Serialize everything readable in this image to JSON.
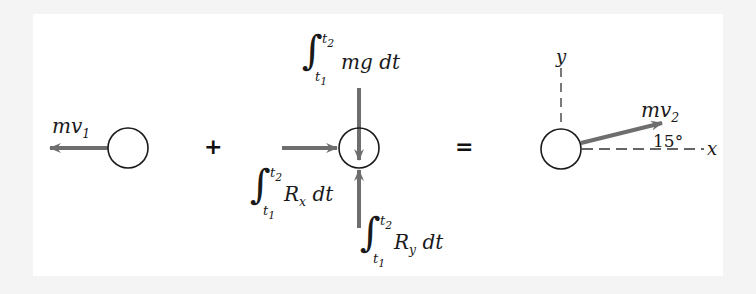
{
  "figure": {
    "type": "impulse-momentum diagram",
    "operators": {
      "plus": "+",
      "equals": "="
    },
    "initial_state": {
      "momentum_label": {
        "base": "mv",
        "sub": "1"
      },
      "arrow_direction": "left"
    },
    "impulses": {
      "gravity": {
        "upper": "t",
        "upper_sub": "2",
        "lower": "t",
        "lower_sub": "1",
        "integrand": "mg dt",
        "arrow_direction": "down"
      },
      "reaction_x": {
        "upper": "t",
        "upper_sub": "2",
        "lower": "t",
        "lower_sub": "1",
        "integrand_base": "R",
        "integrand_sub": "x",
        "integrand_tail": " dt",
        "arrow_direction": "right"
      },
      "reaction_y": {
        "upper": "t",
        "upper_sub": "2",
        "lower": "t",
        "lower_sub": "1",
        "integrand_base": "R",
        "integrand_sub": "y",
        "integrand_tail": " dt",
        "arrow_direction": "up"
      }
    },
    "final_state": {
      "momentum_label": {
        "base": "mv",
        "sub": "2"
      },
      "angle": "15°",
      "axes": {
        "x": "x",
        "y": "y"
      }
    },
    "colors": {
      "arrow": "#6e6e6e",
      "circle": "#1a1a1a",
      "axis_dash": "#333333",
      "background": "#ffffff"
    }
  }
}
